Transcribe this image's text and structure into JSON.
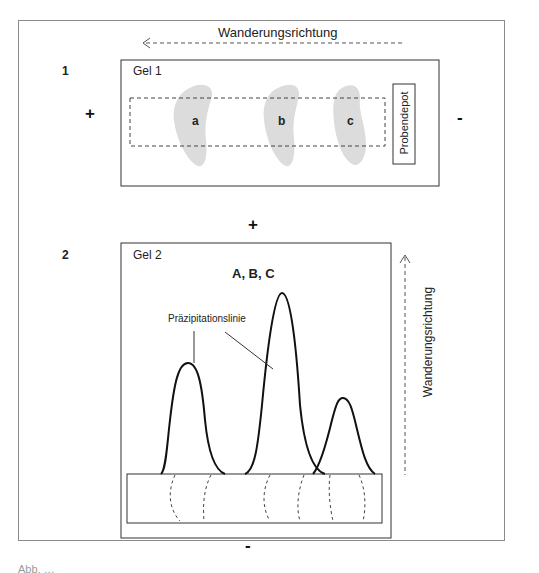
{
  "figure": {
    "panel1": {
      "number": "1",
      "direction_label": "Wanderungsrichtung",
      "direction": "left",
      "gel_label": "Gel 1",
      "anode_sign": "+",
      "cathode_sign": "-",
      "sample_depot_label": "Probendepot",
      "spots": [
        {
          "label": "a"
        },
        {
          "label": "b"
        },
        {
          "label": "c"
        }
      ],
      "spot_color": "#dcdcdc"
    },
    "panel2": {
      "number": "2",
      "gel_label": "Gel 2",
      "antibodies_label": "A, B, C",
      "precipitation_label": "Präzipitationslinie",
      "direction_label": "Wanderungsrichtung",
      "direction": "up",
      "top_sign": "+",
      "bottom_sign": "-",
      "peaks": [
        {
          "name": "a",
          "relative_height": "medium"
        },
        {
          "name": "b",
          "relative_height": "high"
        },
        {
          "name": "c",
          "relative_height": "low"
        }
      ]
    },
    "caption": "Abb. …"
  }
}
